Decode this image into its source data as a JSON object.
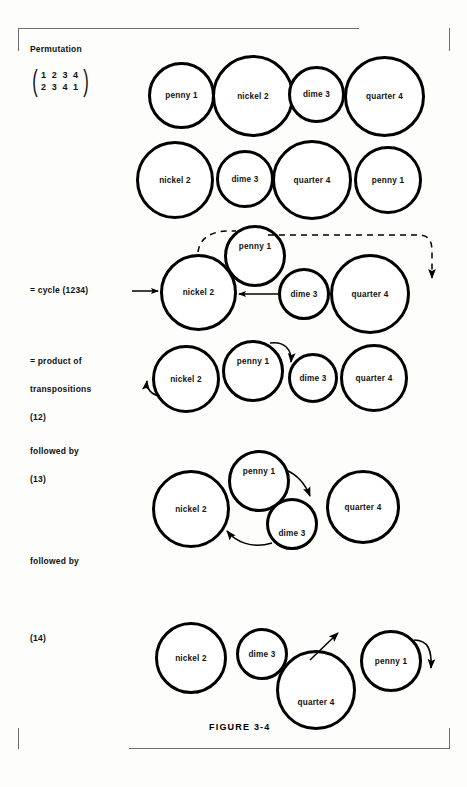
{
  "figure": {
    "caption": "FIGURE 3-4"
  },
  "labels": {
    "permutation": "Permutation",
    "cycle": "= cycle (1234)",
    "product_of": "= product of",
    "transpositions": "transpositions",
    "transposition_12": "(12)",
    "followed_by_1": "followed by",
    "transposition_13": "(13)",
    "followed_by_2": "followed by",
    "transposition_14": "(14)"
  },
  "matrix": {
    "top_row": "1 2 3 4",
    "bottom_row": "2 3 4 1"
  },
  "coins": {
    "penny": "penny 1",
    "nickel": "nickel 2",
    "dime": "dime 3",
    "quarter": "quarter 4"
  },
  "rows": [
    {
      "name": "original-arrangement",
      "coins": [
        {
          "label": "penny 1",
          "x": 148,
          "y": 62,
          "size": 67
        },
        {
          "label": "nickel 2",
          "x": 212,
          "y": 55,
          "size": 82
        },
        {
          "label": "dime 3",
          "x": 288,
          "y": 66,
          "size": 57
        },
        {
          "label": "quarter 4",
          "x": 344,
          "y": 56,
          "size": 81
        }
      ]
    },
    {
      "name": "permuted-arrangement",
      "coins": [
        {
          "label": "nickel 2",
          "x": 136,
          "y": 141,
          "size": 78
        },
        {
          "label": "dime 3",
          "x": 216,
          "y": 150,
          "size": 58
        },
        {
          "label": "quarter 4",
          "x": 272,
          "y": 140,
          "size": 80
        },
        {
          "label": "penny 1",
          "x": 354,
          "y": 146,
          "size": 68
        }
      ]
    },
    {
      "name": "cycle-1234",
      "coins": [
        {
          "label": "penny 1",
          "x": 224,
          "y": 225,
          "size": 62,
          "align": "lbl-top"
        },
        {
          "label": "nickel 2",
          "x": 160,
          "y": 254,
          "size": 77
        },
        {
          "label": "dime 3",
          "x": 278,
          "y": 268,
          "size": 52
        },
        {
          "label": "quarter 4",
          "x": 330,
          "y": 254,
          "size": 80
        }
      ]
    },
    {
      "name": "transposition-12",
      "coins": [
        {
          "label": "nickel 2",
          "x": 152,
          "y": 345,
          "size": 68
        },
        {
          "label": "penny 1",
          "x": 222,
          "y": 340,
          "size": 62,
          "align": "lbl-top"
        },
        {
          "label": "dime 3",
          "x": 288,
          "y": 353,
          "size": 50
        },
        {
          "label": "quarter 4",
          "x": 340,
          "y": 344,
          "size": 68
        }
      ]
    },
    {
      "name": "transposition-13",
      "coins": [
        {
          "label": "nickel 2",
          "x": 152,
          "y": 470,
          "size": 78
        },
        {
          "label": "penny 1",
          "x": 228,
          "y": 450,
          "size": 62,
          "align": "lbl-top"
        },
        {
          "label": "dime 3",
          "x": 266,
          "y": 498,
          "size": 52,
          "align": "lbl-lowish"
        },
        {
          "label": "quarter 4",
          "x": 326,
          "y": 470,
          "size": 74
        }
      ]
    },
    {
      "name": "transposition-14",
      "coins": [
        {
          "label": "nickel 2",
          "x": 155,
          "y": 622,
          "size": 72
        },
        {
          "label": "dime 3",
          "x": 236,
          "y": 628,
          "size": 52
        },
        {
          "label": "quarter 4",
          "x": 276,
          "y": 650,
          "size": 80,
          "align": "lbl-low"
        },
        {
          "label": "penny 1",
          "x": 360,
          "y": 630,
          "size": 62
        }
      ]
    }
  ],
  "arrows": {
    "cycle_dashed": "dashed-arrow-penny-to-right",
    "cycle_to_nickel": "arrow-into-nickel",
    "cycle_dime_to_nickel": "arrow-dime-to-nickel",
    "t12_penny_to_dime": "arrow-penny-to-dime",
    "t12_out_of_nickel": "arrow-out-of-nickel",
    "t13_penny_to_quarter": "arrow-penny-to-quarter",
    "t13_dime_to_nickel": "arrow-dime-to-nickel",
    "t14_up_arrow": "arrow-up-from-quarter",
    "t14_penny_loop": "arrow-penny-loop"
  },
  "colors": {
    "ink": "#000000",
    "paper": "#fdfdfc",
    "bracket": "#6e6e6e"
  }
}
